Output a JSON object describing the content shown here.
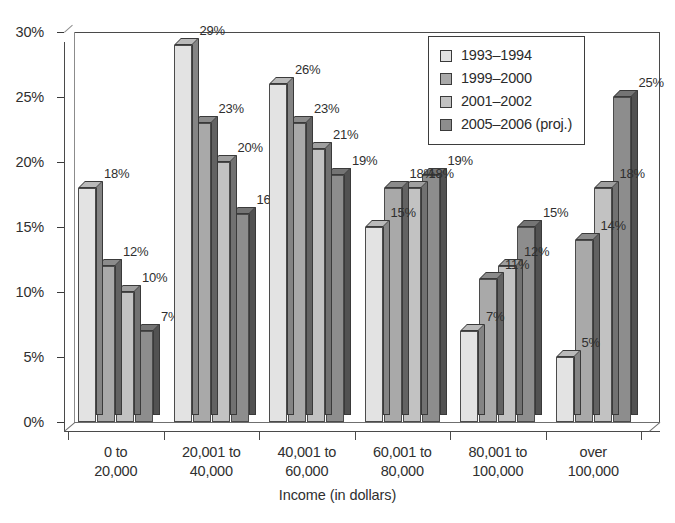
{
  "chart_data": {
    "type": "bar",
    "title": "",
    "xlabel": "Income (in dollars)",
    "ylabel": "",
    "ylim": [
      0,
      30
    ],
    "ytick_labels": [
      "0%",
      "5%",
      "10%",
      "15%",
      "20%",
      "25%",
      "30%"
    ],
    "ytick_values": [
      0,
      5,
      10,
      15,
      20,
      25,
      30
    ],
    "grid": false,
    "legend_position": "top-right",
    "categories": [
      "0 to\n20,000",
      "20,001 to\n40,000",
      "40,001 to\n60,000",
      "60,001 to\n80,000",
      "80,001 to\n100,000",
      "over\n100,000"
    ],
    "category_lines": [
      [
        "0 to",
        "20,000"
      ],
      [
        "20,001 to",
        "40,000"
      ],
      [
        "40,001 to",
        "60,000"
      ],
      [
        "60,001 to",
        "80,000"
      ],
      [
        "80,001 to",
        "100,000"
      ],
      [
        "over",
        "100,000"
      ]
    ],
    "series": [
      {
        "name": "1993–1994",
        "color": "#e3e3e3",
        "values": [
          18,
          29,
          26,
          15,
          7,
          5
        ],
        "labels": [
          "18%",
          "29%",
          "26%",
          "15%",
          "7%",
          "5%"
        ]
      },
      {
        "name": "1999–2000",
        "color": "#a9a9a9",
        "values": [
          12,
          23,
          23,
          18,
          11,
          14
        ],
        "labels": [
          "12%",
          "23%",
          "23%",
          "18%",
          "11%",
          "14%"
        ]
      },
      {
        "name": "2001–2002",
        "color": "#c2c2c2",
        "values": [
          10,
          20,
          21,
          18,
          12,
          18
        ],
        "labels": [
          "10%",
          "20%",
          "21%",
          "18%",
          "12%",
          "18%"
        ]
      },
      {
        "name": "2005–2006 (proj.)",
        "color": "#8d8d8d",
        "values": [
          7,
          16,
          19,
          19,
          15,
          25
        ],
        "labels": [
          "7%",
          "16%",
          "19%",
          "19%",
          "15%",
          "25%"
        ]
      }
    ]
  },
  "legend": {
    "items": [
      {
        "label": "1993–1994",
        "color": "#e3e3e3"
      },
      {
        "label": "1999–2000",
        "color": "#a9a9a9"
      },
      {
        "label": "2001–2002",
        "color": "#c2c2c2"
      },
      {
        "label": "2005–2006 (proj.)",
        "color": "#8d8d8d"
      }
    ]
  }
}
